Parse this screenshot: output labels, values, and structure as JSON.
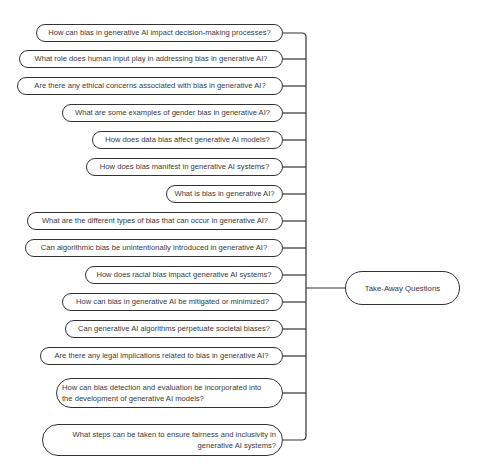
{
  "header": {
    "partial_text": ""
  },
  "central_node": {
    "label": "Take-Away Questions"
  },
  "questions": [
    {
      "label": "How can bias in generative AI impact decision-making processes?"
    },
    {
      "label": "What role does human input play in addressing bias in generative AI?"
    },
    {
      "label": "Are there any ethical concerns associated with bias in generative AI?"
    },
    {
      "label": "What are some examples of gender bias in generative AI?"
    },
    {
      "label": "How does data bias affect generative AI models?"
    },
    {
      "label": "How does bias manifest in generative AI systems?"
    },
    {
      "label": "What is bias in generative AI?"
    },
    {
      "label": "What are the different types of bias that can occur in generative AI?"
    },
    {
      "label": "Can algorithmic bias be unintentionally introduced in generative AI?"
    },
    {
      "label": "How does racial bias impact generative AI systems?"
    },
    {
      "label": "How can bias in generative AI be mitigated or minimized?"
    },
    {
      "label": "Can generative AI algorithms perpetuate societal biases?"
    },
    {
      "label": "Are there any legal implications related to bias in generative AI?"
    },
    {
      "label": "How can bias detection and evaluation be incorporated into the development of generative AI models?"
    },
    {
      "label": "What steps can be taken to ensure fairness and inclusivity in generative AI systems?"
    }
  ],
  "colors": {
    "line": "#333333",
    "text": "#3a3a3a",
    "background": "#ffffff"
  }
}
